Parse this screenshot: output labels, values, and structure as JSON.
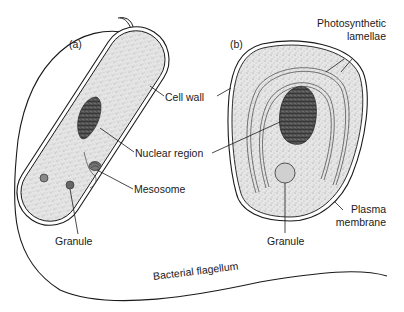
{
  "figure": {
    "panel_a_label": "(a)",
    "panel_b_label": "(b)",
    "colors": {
      "ink": "#1a1a1a",
      "cytoplasm": "#d9d9d9",
      "nucleoid": "#4a4a4a",
      "background": "#ffffff"
    }
  },
  "labels": {
    "cell_wall": "Cell wall",
    "nuclear_region": "Nuclear region",
    "mesosome": "Mesosome",
    "granule_a": "Granule",
    "photosynthetic_line1": "Photosynthetic",
    "photosynthetic_line2": "lamellae",
    "plasma_line1": "Plasma",
    "plasma_line2": "membrane",
    "granule_b": "Granule",
    "flagellum": "Bacterial flagellum"
  }
}
